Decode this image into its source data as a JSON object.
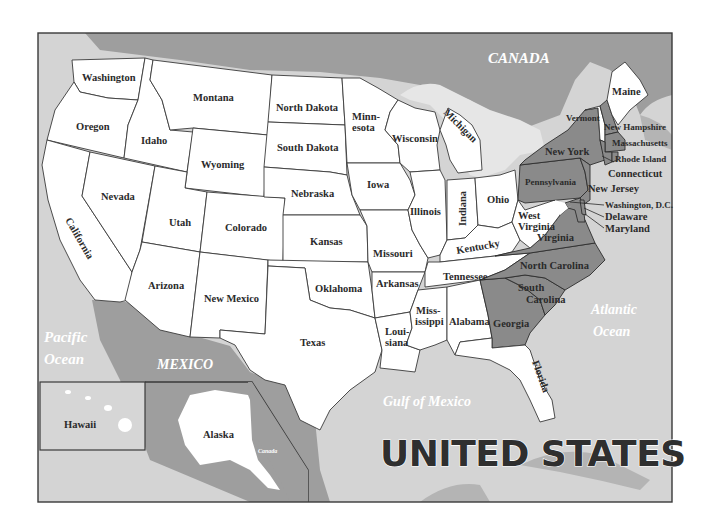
{
  "map": {
    "title": "UNITED STATES",
    "colors": {
      "land_us": "#ffffff",
      "highlight_states": "#8a8a8a",
      "foreign_land": "#9c9c9c",
      "water": "#d2d2d2",
      "great_lakes": "#e4e4e4",
      "border": "#3a3a3a",
      "label": "#2b2b2b"
    },
    "countries": {
      "canada": "CANADA",
      "mexico": "MEXICO",
      "canada_inset": "Canada"
    },
    "water": {
      "pacific_line1": "Pacific",
      "pacific_line2": "Ocean",
      "atlantic_line1": "Atlantic",
      "atlantic_line2": "Ocean",
      "gulf": "Gulf of Mexico"
    },
    "insets": {
      "hawaii": "Hawaii",
      "alaska": "Alaska"
    },
    "states": {
      "washington": "Washington",
      "oregon": "Oregon",
      "california": "California",
      "idaho": "Idaho",
      "nevada": "Nevada",
      "montana": "Montana",
      "wyoming": "Wyoming",
      "utah": "Utah",
      "colorado": "Colorado",
      "arizona": "Arizona",
      "new_mexico": "New Mexico",
      "north_dakota": "North Dakota",
      "south_dakota": "South Dakota",
      "nebraska": "Nebraska",
      "kansas": "Kansas",
      "oklahoma": "Oklahoma",
      "texas": "Texas",
      "minnesota_1": "Minn-",
      "minnesota_2": "esota",
      "iowa": "Iowa",
      "missouri": "Missouri",
      "arkansas": "Arkansas",
      "louisiana_1": "Loui-",
      "louisiana_2": "siana",
      "wisconsin": "Wisconsin",
      "illinois": "Illinois",
      "michigan": "Michigan",
      "indiana": "Indiana",
      "ohio": "Ohio",
      "kentucky": "Kentucky",
      "tennessee": "Tennessee",
      "mississippi_1": "Miss-",
      "mississippi_2": "issippi",
      "alabama": "Alabama",
      "georgia": "Georgia",
      "florida": "Florida",
      "south_carolina_1": "South",
      "south_carolina_2": "Carolina",
      "north_carolina": "North Carolina",
      "virginia": "Virginia",
      "west_virginia_1": "West",
      "west_virginia_2": "Virginia",
      "pennsylvania": "Pennsylvania",
      "new_york": "New York",
      "vermont": "Vermont",
      "new_hampshire": "New Hampshire",
      "maine": "Maine",
      "massachusetts": "Massachusetts",
      "rhode_island": "Rhode Island",
      "connecticut": "Connecticut",
      "new_jersey": "New Jersey",
      "washington_dc": "Washington, D.C.",
      "delaware": "Delaware",
      "maryland": "Maryland"
    }
  }
}
